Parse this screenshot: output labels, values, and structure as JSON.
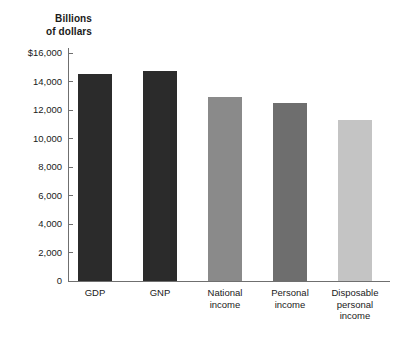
{
  "chart_data": {
    "type": "bar",
    "title": "",
    "axis_caption": "Billions\nof dollars",
    "axis_caption_line1": "Billions",
    "axis_caption_line2": "of dollars",
    "categories": [
      "GDP",
      "GNP",
      "National income",
      "Personal income",
      "Disposable personal income"
    ],
    "category_label_lines": [
      [
        "GDP"
      ],
      [
        "GNP"
      ],
      [
        "National",
        "income"
      ],
      [
        "Personal",
        "income"
      ],
      [
        "Disposable",
        "personal",
        "income"
      ]
    ],
    "values": [
      14520,
      14730,
      12900,
      12470,
      11270
    ],
    "bar_colors": [
      "#2b2b2b",
      "#2b2b2b",
      "#8a8a8a",
      "#6e6e6e",
      "#c4c4c4"
    ],
    "xlabel": "",
    "ylabel": "Billions of dollars",
    "ylim": [
      0,
      16000
    ],
    "ytick_values": [
      16000,
      14000,
      12000,
      10000,
      8000,
      6000,
      4000,
      2000,
      0
    ],
    "ytick_labels": [
      "$16,000",
      "14,000",
      "12,000",
      "10,000",
      "8,000",
      "6,000",
      "4,000",
      "2,000",
      "0"
    ],
    "grid": false,
    "legend": "none",
    "axis_color": "#6f6f6f",
    "background_color": "#ffffff"
  }
}
